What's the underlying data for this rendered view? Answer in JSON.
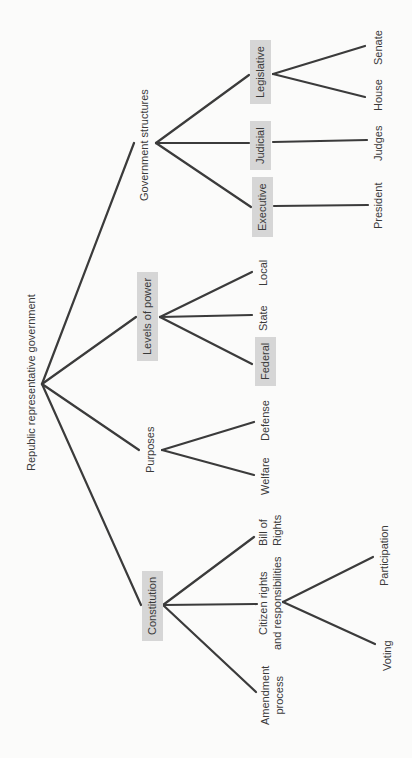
{
  "diagram": {
    "type": "tree",
    "orientation": "rotated-90-ccw",
    "colors": {
      "background": "#fbfbfa",
      "line": "#3b3b3b",
      "box_fill": "#d6d6d6",
      "text": "#3a3a3a"
    },
    "root": {
      "label": "Republic representative government"
    },
    "branches": {
      "government_structures": {
        "label": "Government structures",
        "children": {
          "legislative": {
            "label": "Legisative_placeholder"
          },
          "judicial": {
            "label": "Judicial"
          },
          "executive": {
            "label": "Executive"
          }
        }
      }
    }
  },
  "nodes": {
    "root": "Republic representative government",
    "government_structures": "Government structures",
    "legislative": "Legislative",
    "judicial": "Judicial",
    "executive": "Executive",
    "senate": "Senate",
    "house": "House",
    "judges": "Judges",
    "president": "President",
    "levels_of_power": "Levels of power",
    "local": "Local",
    "state": "State",
    "federal": "Federal",
    "purposes": "Purposes",
    "defense": "Defense",
    "welfare": "Welfare",
    "constitution": "Constitution",
    "bill_of_rights": {
      "line1": "Bill of",
      "line2": "Rights"
    },
    "citizen_rights": {
      "line1": "Citizen rights",
      "line2": "and responsibilities"
    },
    "amendment_process": {
      "line1": "Amendment",
      "line2": "process"
    },
    "participation": "Participation",
    "voting": "Voting"
  },
  "edges": [
    {
      "from": "root",
      "to": "government_structures",
      "x1": 42,
      "y1": 384,
      "x2": 134,
      "y2": 143
    },
    {
      "from": "root",
      "to": "levels_of_power",
      "x1": 42,
      "y1": 384,
      "x2": 136,
      "y2": 317
    },
    {
      "from": "root",
      "to": "purposes",
      "x1": 42,
      "y1": 384,
      "x2": 139,
      "y2": 450
    },
    {
      "from": "root",
      "to": "constitution",
      "x1": 42,
      "y1": 384,
      "x2": 141,
      "y2": 605
    },
    {
      "from": "government_structures",
      "to": "legislative",
      "x1": 156,
      "y1": 143,
      "x2": 249,
      "y2": 75
    },
    {
      "from": "government_structures",
      "to": "judicial",
      "x1": 156,
      "y1": 143,
      "x2": 249,
      "y2": 143
    },
    {
      "from": "government_structures",
      "to": "executive",
      "x1": 156,
      "y1": 143,
      "x2": 251,
      "y2": 207
    },
    {
      "from": "legislative",
      "to": "senate",
      "x1": 273,
      "y1": 74,
      "x2": 365,
      "y2": 46
    },
    {
      "from": "legislative",
      "to": "house",
      "x1": 273,
      "y1": 74,
      "x2": 365,
      "y2": 97
    },
    {
      "from": "judicial",
      "to": "judges",
      "x1": 273,
      "y1": 142,
      "x2": 367,
      "y2": 140
    },
    {
      "from": "executive",
      "to": "president",
      "x1": 274,
      "y1": 206,
      "x2": 368,
      "y2": 205
    },
    {
      "from": "levels_of_power",
      "to": "local",
      "x1": 160,
      "y1": 317,
      "x2": 252,
      "y2": 272
    },
    {
      "from": "levels_of_power",
      "to": "state",
      "x1": 160,
      "y1": 317,
      "x2": 252,
      "y2": 315
    },
    {
      "from": "levels_of_power",
      "to": "federal",
      "x1": 160,
      "y1": 317,
      "x2": 252,
      "y2": 364
    },
    {
      "from": "purposes",
      "to": "defense",
      "x1": 162,
      "y1": 450,
      "x2": 254,
      "y2": 422
    },
    {
      "from": "purposes",
      "to": "welfare",
      "x1": 162,
      "y1": 450,
      "x2": 254,
      "y2": 475
    },
    {
      "from": "constitution",
      "to": "bill_of_rights",
      "x1": 163,
      "y1": 605,
      "x2": 254,
      "y2": 537
    },
    {
      "from": "constitution",
      "to": "citizen_rights",
      "x1": 163,
      "y1": 605,
      "x2": 257,
      "y2": 604
    },
    {
      "from": "constitution",
      "to": "amendment_process",
      "x1": 163,
      "y1": 605,
      "x2": 256,
      "y2": 692
    },
    {
      "from": "citizen_rights",
      "to": "participation",
      "x1": 283,
      "y1": 602,
      "x2": 373,
      "y2": 557
    },
    {
      "from": "citizen_rights",
      "to": "voting",
      "x1": 283,
      "y1": 602,
      "x2": 375,
      "y2": 644
    }
  ]
}
